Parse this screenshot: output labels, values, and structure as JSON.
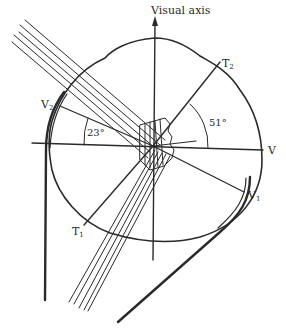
{
  "figure": {
    "labels": {
      "visual_axis": "Visual axis",
      "t2": "T",
      "t2_sub": "2",
      "v": "V",
      "v2": "V",
      "v2_sub": "2",
      "v1": "V",
      "v1_sub": "1",
      "t1": "T",
      "t1_sub": "1",
      "angle_left": "23°",
      "angle_right": "51°"
    },
    "angles": {
      "left_deg": 23,
      "right_deg": 51
    },
    "colors": {
      "ink": "#2a2a2a",
      "background": "#ffffff"
    }
  }
}
